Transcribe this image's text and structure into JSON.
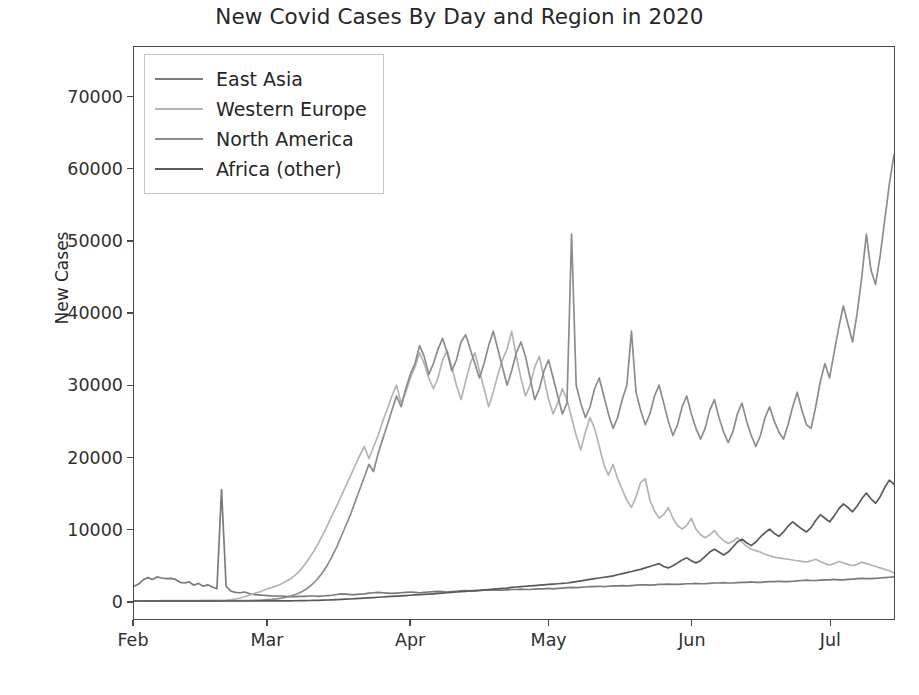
{
  "chart_data": {
    "type": "line",
    "title": "New Covid Cases By Day and Region in 2020",
    "xlabel": "",
    "ylabel": "New Cases",
    "grid": false,
    "legend_position": "upper left",
    "ylim": [
      -2500,
      77000
    ],
    "yticks": [
      0,
      10000,
      20000,
      30000,
      40000,
      50000,
      60000,
      70000
    ],
    "ytick_labels": [
      "0",
      "10000",
      "20000",
      "30000",
      "40000",
      "50000",
      "60000",
      "70000"
    ],
    "xticks": [
      "Feb",
      "Mar",
      "Apr",
      "May",
      "Jun",
      "Jul"
    ],
    "xtick_positions_day": [
      0,
      29,
      60,
      90,
      121,
      151
    ],
    "x_start_label": "Feb 1",
    "x_end_label": "Jul 15",
    "n_days": 166,
    "series": [
      {
        "name": "East Asia",
        "color": "#7a7a7a",
        "values": [
          2050,
          2350,
          2950,
          3250,
          3000,
          3350,
          3200,
          3100,
          3150,
          3000,
          2600,
          2500,
          2650,
          2200,
          2450,
          2050,
          2250,
          1950,
          1700,
          15500,
          2050,
          1400,
          1200,
          1150,
          1250,
          1050,
          900,
          850,
          800,
          750,
          700,
          700,
          700,
          650,
          600,
          600,
          650,
          650,
          700,
          700,
          650,
          700,
          750,
          800,
          900,
          1000,
          950,
          900,
          900,
          950,
          1000,
          1100,
          1150,
          1200,
          1150,
          1100,
          1050,
          1100,
          1150,
          1200,
          1250,
          1200,
          1150,
          1200,
          1250,
          1300,
          1350,
          1300,
          1250,
          1300,
          1350,
          1400,
          1450,
          1400,
          1400,
          1450,
          1500,
          1500,
          1550,
          1500,
          1500,
          1550,
          1600,
          1600,
          1650,
          1600,
          1600,
          1650,
          1700,
          1700,
          1750,
          1700,
          1750,
          1800,
          1850,
          1900,
          1850,
          1900,
          1950,
          2000,
          2000,
          2050,
          2000,
          2050,
          2100,
          2100,
          2150,
          2100,
          2150,
          2200,
          2250,
          2250,
          2200,
          2250,
          2300,
          2300,
          2350,
          2300,
          2300,
          2350,
          2400,
          2400,
          2450,
          2400,
          2400,
          2450,
          2500,
          2500,
          2550,
          2500,
          2500,
          2550,
          2600,
          2600,
          2650,
          2600,
          2600,
          2650,
          2700,
          2700,
          2750,
          2700,
          2700,
          2750,
          2800,
          2850,
          2900,
          2850,
          2850,
          2900,
          2950,
          2950,
          3000,
          2950,
          2950,
          3000,
          3050,
          3100,
          3150,
          3100,
          3100,
          3150,
          3200,
          3250,
          3300,
          3350,
          3300,
          3250
        ]
      },
      {
        "name": "Western Europe",
        "color": "#b4b4b4",
        "values": [
          20,
          25,
          30,
          35,
          40,
          40,
          45,
          50,
          55,
          55,
          60,
          60,
          65,
          70,
          75,
          80,
          85,
          90,
          100,
          110,
          130,
          180,
          280,
          420,
          600,
          820,
          1050,
          1200,
          1450,
          1700,
          1900,
          2100,
          2400,
          2750,
          3100,
          3600,
          4200,
          5000,
          5900,
          6900,
          8000,
          9200,
          10500,
          11900,
          13200,
          14600,
          16000,
          17400,
          18800,
          20200,
          21500,
          19800,
          21400,
          23000,
          25000,
          26700,
          28500,
          30000,
          27500,
          29000,
          31000,
          32500,
          34500,
          33000,
          31000,
          29500,
          31000,
          33500,
          34800,
          32500,
          30000,
          28000,
          30500,
          33000,
          34500,
          32000,
          29500,
          27000,
          29000,
          31500,
          33500,
          35000,
          37500,
          34000,
          31000,
          28500,
          30000,
          32500,
          34000,
          31000,
          28000,
          26000,
          27500,
          29500,
          28000,
          25500,
          23000,
          21000,
          23500,
          25500,
          24000,
          21500,
          19000,
          17500,
          19000,
          17000,
          15500,
          14000,
          13000,
          14500,
          16500,
          17000,
          14000,
          12500,
          11500,
          12000,
          13000,
          11500,
          10500,
          10000,
          10500,
          11500,
          10000,
          9200,
          8800,
          9200,
          9800,
          9000,
          8400,
          8000,
          8300,
          8800,
          8200,
          7600,
          7200,
          7000,
          6800,
          6500,
          6300,
          6100,
          6000,
          5900,
          5800,
          5700,
          5600,
          5500,
          5400,
          5600,
          5800,
          5500,
          5200,
          5000,
          5200,
          5500,
          5300,
          5100,
          4900,
          5100,
          5400,
          5200,
          5000,
          4800,
          4600,
          4400,
          4200,
          3900,
          3700
        ]
      },
      {
        "name": "North America",
        "color": "#8c8c8c",
        "values": [
          5,
          5,
          8,
          8,
          10,
          10,
          12,
          12,
          15,
          15,
          18,
          18,
          20,
          20,
          22,
          25,
          25,
          28,
          30,
          30,
          35,
          40,
          45,
          50,
          60,
          70,
          90,
          110,
          140,
          180,
          230,
          300,
          400,
          520,
          680,
          900,
          1150,
          1500,
          1950,
          2500,
          3200,
          4000,
          5000,
          6200,
          7500,
          9000,
          10500,
          12000,
          13800,
          15500,
          17200,
          19000,
          18000,
          20500,
          22500,
          24500,
          26500,
          28500,
          27000,
          29500,
          31500,
          33000,
          35500,
          34000,
          31500,
          33000,
          35000,
          36500,
          34500,
          32000,
          33500,
          36000,
          37000,
          35000,
          33000,
          31000,
          33000,
          35500,
          37500,
          35000,
          32500,
          30000,
          32000,
          34500,
          36000,
          34000,
          31000,
          28000,
          29500,
          32000,
          33500,
          31000,
          28500,
          26000,
          27500,
          51000,
          30000,
          27500,
          25500,
          27000,
          29500,
          31000,
          28500,
          26000,
          24000,
          25500,
          28000,
          30000,
          37500,
          29000,
          26500,
          24500,
          26000,
          28500,
          30000,
          27500,
          25000,
          23000,
          24500,
          27000,
          28500,
          26000,
          24000,
          22500,
          24000,
          26500,
          28000,
          25500,
          23500,
          22000,
          23500,
          26000,
          27500,
          25000,
          23000,
          21500,
          23000,
          25500,
          27000,
          25000,
          23500,
          22500,
          24500,
          27000,
          29000,
          26500,
          24500,
          24000,
          27000,
          30500,
          33000,
          31000,
          34500,
          38000,
          41000,
          38500,
          36000,
          40000,
          45000,
          51000,
          46000,
          44000,
          48000,
          53000,
          58000,
          62000,
          58000,
          56000,
          53000,
          58000,
          64000,
          70000,
          74000,
          71000,
          70000
        ]
      },
      {
        "name": "Africa (other)",
        "color": "#5a5a5a",
        "values": [
          0,
          0,
          0,
          0,
          0,
          0,
          0,
          0,
          0,
          0,
          0,
          0,
          0,
          0,
          0,
          0,
          0,
          0,
          0,
          0,
          0,
          0,
          0,
          0,
          0,
          5,
          5,
          8,
          10,
          12,
          15,
          18,
          20,
          25,
          30,
          35,
          45,
          55,
          70,
          85,
          100,
          120,
          140,
          165,
          190,
          220,
          250,
          280,
          320,
          360,
          400,
          440,
          480,
          520,
          560,
          600,
          640,
          680,
          720,
          760,
          800,
          840,
          880,
          920,
          960,
          1000,
          1050,
          1100,
          1150,
          1200,
          1250,
          1300,
          1350,
          1400,
          1450,
          1500,
          1550,
          1600,
          1650,
          1700,
          1750,
          1800,
          1900,
          1950,
          2000,
          2050,
          2100,
          2150,
          2200,
          2250,
          2300,
          2350,
          2400,
          2450,
          2500,
          2600,
          2700,
          2800,
          2900,
          3000,
          3100,
          3200,
          3300,
          3400,
          3500,
          3650,
          3800,
          3950,
          4100,
          4250,
          4400,
          4600,
          4800,
          5000,
          5200,
          4800,
          4600,
          4900,
          5300,
          5700,
          6000,
          5600,
          5300,
          5600,
          6200,
          6800,
          7200,
          6800,
          6400,
          6800,
          7500,
          8200,
          8600,
          8100,
          7700,
          8200,
          8900,
          9500,
          10000,
          9400,
          9000,
          9600,
          10400,
          11000,
          10500,
          10000,
          9600,
          10200,
          11200,
          12000,
          11500,
          11000,
          11800,
          12800,
          13500,
          13000,
          12400,
          13200,
          14200,
          15000,
          14200,
          13600,
          14500,
          15800,
          16800,
          16200,
          17500
        ]
      }
    ]
  }
}
